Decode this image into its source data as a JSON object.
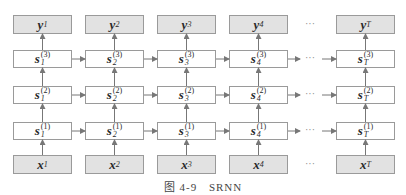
{
  "diagram": {
    "type": "stacked-rnn",
    "columns": [
      {
        "id": "1",
        "y": "y",
        "y_sub": "1",
        "x": "x",
        "x_sub": "1",
        "s_sub": "1"
      },
      {
        "id": "2",
        "y": "y",
        "y_sub": "2",
        "x": "x",
        "x_sub": "2",
        "s_sub": "2"
      },
      {
        "id": "3",
        "y": "y",
        "y_sub": "3",
        "x": "x",
        "x_sub": "3",
        "s_sub": "3"
      },
      {
        "id": "4",
        "y": "y",
        "y_sub": "4",
        "x": "x",
        "x_sub": "4",
        "s_sub": "4"
      },
      {
        "id": "T",
        "y": "y",
        "y_sub": "T",
        "x": "x",
        "x_sub": "T",
        "s_sub": "T"
      }
    ],
    "layers": [
      {
        "name": "s",
        "superscript": "(3)"
      },
      {
        "name": "s",
        "superscript": "(2)"
      },
      {
        "name": "s",
        "superscript": "(1)"
      }
    ],
    "ellipsis": "···",
    "colors": {
      "shaded_fill": "#e2e2e2",
      "border": "#9a9a9a",
      "arrow": "#777777"
    }
  },
  "caption": {
    "figure_label": "图 4-9",
    "title": "SRNN"
  }
}
